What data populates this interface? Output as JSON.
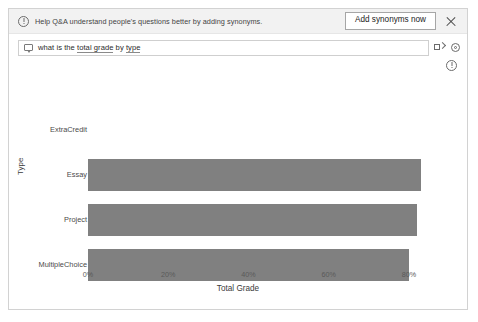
{
  "notification": {
    "icon": "info-circle-icon",
    "message": "Help Q&A understand people's questions better by adding synonyms.",
    "action_label": "Add synonyms now",
    "close_icon": "close-icon"
  },
  "query": {
    "icon": "speech-bubble-icon",
    "text_plain": "what is the total grade by type",
    "prefix": "what is the ",
    "entity_1": "total grade",
    "middle": " by ",
    "entity_2": "type",
    "tools": [
      {
        "name": "rephrase-icon"
      },
      {
        "name": "settings-icon"
      }
    ]
  },
  "info_row": {
    "icon": "info-circle-icon"
  },
  "chart_data": {
    "type": "bar",
    "orientation": "horizontal",
    "title": "",
    "xlabel": "Total Grade",
    "ylabel": "Type",
    "categories": [
      "ExtraCredit",
      "Essay",
      "Project",
      "MultipleChoice"
    ],
    "values": [
      0,
      83,
      82,
      80
    ],
    "value_suffix": "%",
    "xlim": [
      0,
      83
    ],
    "xticks": [
      "0%",
      "20%",
      "40%",
      "60%",
      "80%"
    ],
    "xtick_values": [
      0,
      20,
      40,
      60,
      80
    ],
    "grid": false,
    "legend": "none",
    "bar_color": "#808080"
  }
}
